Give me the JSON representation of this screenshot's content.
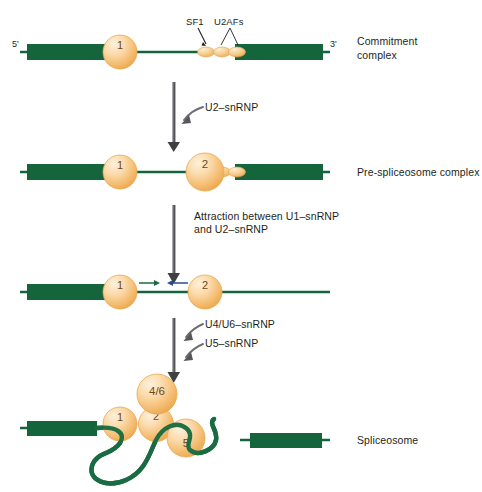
{
  "figure": {
    "colors": {
      "exon_green": "#14653c",
      "intron_green": "#1a6b41",
      "snrnp_orange_light": "#fbdcae",
      "snrnp_orange": "#f3b35c",
      "snrnp_edge": "#e09a3e",
      "text": "#231f20",
      "arrow_gray": "#58595b"
    },
    "end_labels": {
      "five_prime": "5'",
      "three_prime": "3'"
    },
    "stages": [
      {
        "id": "commitment-complex",
        "name_line1": "Commitment",
        "name_line2": "complex",
        "snrnps": [
          {
            "label": "1"
          }
        ],
        "factor_labels": [
          {
            "label": "SF1"
          },
          {
            "label": "U2AFs"
          }
        ],
        "small_factors": 3
      },
      {
        "id": "pre-spliceosome-complex",
        "name_line1": "Pre-spliceosome complex",
        "name_line2": "",
        "snrnps": [
          {
            "label": "1"
          },
          {
            "label": "2"
          }
        ],
        "small_factors": 2
      },
      {
        "id": "attraction-complex",
        "name_line1": "",
        "name_line2": "",
        "snrnps": [
          {
            "label": "1"
          },
          {
            "label": "2"
          }
        ],
        "small_factors": 0
      },
      {
        "id": "spliceosome",
        "name_line1": "Spliceosome",
        "name_line2": "",
        "snrnps": [
          {
            "label": "1"
          },
          {
            "label": "2"
          },
          {
            "label": "4/6"
          },
          {
            "label": "5"
          }
        ],
        "small_factors": 0
      }
    ],
    "transitions": [
      {
        "id": "transition-u2",
        "labels": [
          "U2–snRNP"
        ],
        "arrow_count": 1
      },
      {
        "id": "transition-attraction",
        "labels": [
          "Attraction between U1–snRNP",
          "and U2–snRNP"
        ],
        "arrow_count": 0
      },
      {
        "id": "transition-u4u6-u5",
        "labels": [
          "U4/U6–snRNP",
          "U5–snRNP"
        ],
        "arrow_count": 2
      }
    ]
  }
}
